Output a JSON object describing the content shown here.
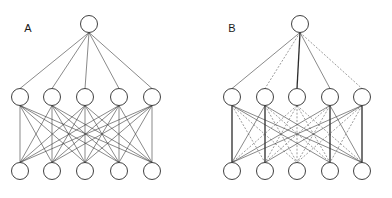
{
  "figure": {
    "title": "",
    "width": 392,
    "height": 198,
    "background_color": "#ffffff"
  },
  "panels": [
    {
      "id": "A",
      "label": "A",
      "label_x": 28,
      "label_y": 32,
      "description": "Fully connected neural network diagram with all solid edges",
      "layers": [
        {
          "name": "top-layer",
          "y": 24,
          "radius": 8.5,
          "nodes": [
            {
              "x": 89
            }
          ]
        },
        {
          "name": "middle-layer",
          "y": 97,
          "radius": 8.5,
          "nodes": [
            {
              "x": 20
            },
            {
              "x": 52
            },
            {
              "x": 85
            },
            {
              "x": 119
            },
            {
              "x": 152
            }
          ]
        },
        {
          "name": "bottom-layer",
          "y": 171,
          "radius": 8.5,
          "nodes": [
            {
              "x": 20
            },
            {
              "x": 52
            },
            {
              "x": 85
            },
            {
              "x": 119
            },
            {
              "x": 152
            }
          ]
        }
      ],
      "edges_top_to_middle": [
        {
          "from": 0,
          "to": 0,
          "style": "solid"
        },
        {
          "from": 0,
          "to": 1,
          "style": "solid"
        },
        {
          "from": 0,
          "to": 2,
          "style": "solid"
        },
        {
          "from": 0,
          "to": 3,
          "style": "solid"
        },
        {
          "from": 0,
          "to": 4,
          "style": "solid"
        }
      ],
      "edges_middle_to_bottom_style": "all-solid"
    },
    {
      "id": "B",
      "label": "B",
      "label_x": 232,
      "label_y": 32,
      "description": "Same network with a subset of edges drawn dashed (pruned or inactive connections)",
      "layers": [
        {
          "name": "top-layer",
          "y": 24,
          "radius": 8.5,
          "nodes": [
            {
              "x": 300
            }
          ]
        },
        {
          "name": "middle-layer",
          "y": 97,
          "radius": 8.5,
          "nodes": [
            {
              "x": 232
            },
            {
              "x": 265
            },
            {
              "x": 297
            },
            {
              "x": 330
            },
            {
              "x": 362
            }
          ]
        },
        {
          "name": "bottom-layer",
          "y": 171,
          "radius": 8.5,
          "nodes": [
            {
              "x": 232
            },
            {
              "x": 265
            },
            {
              "x": 297
            },
            {
              "x": 330
            },
            {
              "x": 362
            }
          ]
        }
      ],
      "edges_top_to_middle": [
        {
          "from": 0,
          "to": 0,
          "style": "solid"
        },
        {
          "from": 0,
          "to": 1,
          "style": "dashed"
        },
        {
          "from": 0,
          "to": 2,
          "style": "solid-strong"
        },
        {
          "from": 0,
          "to": 3,
          "style": "solid"
        },
        {
          "from": 0,
          "to": 4,
          "style": "dashed"
        }
      ],
      "edges_middle_to_bottom": [
        {
          "from": 0,
          "to": 0,
          "style": "solid-strong"
        },
        {
          "from": 0,
          "to": 1,
          "style": "dashed"
        },
        {
          "from": 0,
          "to": 2,
          "style": "dashed"
        },
        {
          "from": 0,
          "to": 3,
          "style": "solid"
        },
        {
          "from": 0,
          "to": 4,
          "style": "solid"
        },
        {
          "from": 1,
          "to": 0,
          "style": "solid"
        },
        {
          "from": 1,
          "to": 1,
          "style": "solid-strong"
        },
        {
          "from": 1,
          "to": 2,
          "style": "dashed"
        },
        {
          "from": 1,
          "to": 3,
          "style": "dashed"
        },
        {
          "from": 1,
          "to": 4,
          "style": "solid"
        },
        {
          "from": 2,
          "to": 0,
          "style": "dashed"
        },
        {
          "from": 2,
          "to": 1,
          "style": "dashed"
        },
        {
          "from": 2,
          "to": 2,
          "style": "dashed"
        },
        {
          "from": 2,
          "to": 3,
          "style": "dashed"
        },
        {
          "from": 2,
          "to": 4,
          "style": "dashed"
        },
        {
          "from": 3,
          "to": 0,
          "style": "solid"
        },
        {
          "from": 3,
          "to": 1,
          "style": "dashed"
        },
        {
          "from": 3,
          "to": 2,
          "style": "dashed"
        },
        {
          "from": 3,
          "to": 3,
          "style": "solid-strong"
        },
        {
          "from": 3,
          "to": 4,
          "style": "solid"
        },
        {
          "from": 4,
          "to": 0,
          "style": "solid"
        },
        {
          "from": 4,
          "to": 1,
          "style": "solid"
        },
        {
          "from": 4,
          "to": 2,
          "style": "dashed"
        },
        {
          "from": 4,
          "to": 3,
          "style": "dashed"
        },
        {
          "from": 4,
          "to": 4,
          "style": "solid-strong"
        }
      ]
    }
  ]
}
